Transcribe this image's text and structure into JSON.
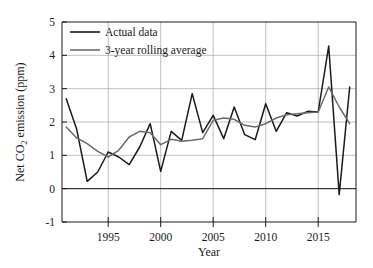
{
  "chart_data": {
    "type": "line",
    "title": "",
    "xlabel": "Year",
    "ylabel": "Net CO2 emission (ppm)",
    "ylabel_parts": {
      "pre": "Net CO",
      "sub": "2",
      "post": " emission (ppm)"
    },
    "xlim": [
      1990.6,
      2018.6
    ],
    "ylim": [
      -1,
      5
    ],
    "xticks": [
      1995,
      2000,
      2005,
      2010,
      2015
    ],
    "xtick_labels": [
      "1995",
      "2000",
      "2005",
      "2010",
      "2015"
    ],
    "yticks": [
      -1,
      0,
      1,
      2,
      3,
      4,
      5
    ],
    "ytick_labels": [
      "-1",
      "0",
      "1",
      "2",
      "3",
      "4",
      "5"
    ],
    "grid": true,
    "grid_color": "#b0b0b0",
    "legend_position": "top-left",
    "x": [
      1991,
      1992,
      1993,
      1994,
      1995,
      1996,
      1997,
      1998,
      1999,
      2000,
      2001,
      2002,
      2003,
      2004,
      2005,
      2006,
      2007,
      2008,
      2009,
      2010,
      2011,
      2012,
      2013,
      2014,
      2015,
      2016,
      2017,
      2018
    ],
    "series": [
      {
        "name": "Actual data",
        "color": "#1a1a1a",
        "width": 1.5,
        "values": [
          2.7,
          1.78,
          0.22,
          0.5,
          1.1,
          0.95,
          0.72,
          1.25,
          1.95,
          0.52,
          1.72,
          1.45,
          2.85,
          1.68,
          2.2,
          1.5,
          2.45,
          1.62,
          1.47,
          2.55,
          1.72,
          2.28,
          2.18,
          2.32,
          2.3,
          4.28,
          -0.18,
          3.05
        ]
      },
      {
        "name": "3-year rolling average",
        "color": "#6b6b6b",
        "width": 1.5,
        "values": [
          1.85,
          1.52,
          1.35,
          1.12,
          0.95,
          1.15,
          1.55,
          1.72,
          1.68,
          1.32,
          1.48,
          1.42,
          1.45,
          1.5,
          2.05,
          2.12,
          2.08,
          1.9,
          1.85,
          1.95,
          2.12,
          2.22,
          2.25,
          2.28,
          2.3,
          3.05,
          2.45,
          1.95
        ]
      }
    ]
  },
  "legend": {
    "items": [
      {
        "label": "Actual data",
        "color": "#1a1a1a"
      },
      {
        "label": "3-year rolling average",
        "color": "#6b6b6b"
      }
    ]
  }
}
